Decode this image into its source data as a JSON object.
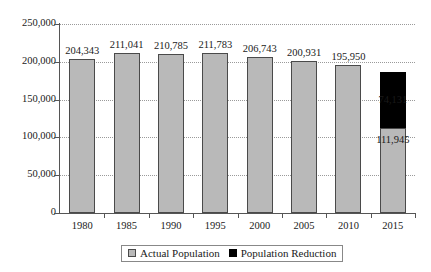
{
  "chart_data": {
    "type": "bar",
    "title": "",
    "subtitle": "",
    "xlabel": "",
    "ylabel": "",
    "categories": [
      "1980",
      "1985",
      "1990",
      "1995",
      "2000",
      "2005",
      "2010",
      "2015"
    ],
    "series": [
      {
        "name": "Actual Population",
        "color": "#b9b9b9",
        "values": [
          204343,
          211041,
          210785,
          211783,
          206743,
          200931,
          195950,
          111945
        ],
        "labels": [
          "204,343",
          "211,041",
          "210,785",
          "211,783",
          "206,743",
          "200,931",
          "195,950",
          "111,945"
        ]
      },
      {
        "name": "Population Reduction",
        "color": "#000000",
        "values": [
          0,
          0,
          0,
          0,
          0,
          0,
          0,
          74131
        ],
        "labels": [
          "",
          "",
          "",
          "",
          "",
          "",
          "",
          "74,131"
        ]
      }
    ],
    "stacked": true,
    "ylim": [
      0,
      250000
    ],
    "ytick_values": [
      0,
      50000,
      100000,
      150000,
      200000,
      250000
    ],
    "ytick_labels": [
      "0",
      "50,000",
      "100,000",
      "150,000",
      "200,000",
      "250,000"
    ],
    "grid": "horizontal-dotted",
    "legend_position": "bottom-center"
  },
  "legend": {
    "items": [
      {
        "label": "Actual Population",
        "swatch": "gray-square"
      },
      {
        "label": "Population Reduction",
        "swatch": "black-square"
      }
    ]
  }
}
